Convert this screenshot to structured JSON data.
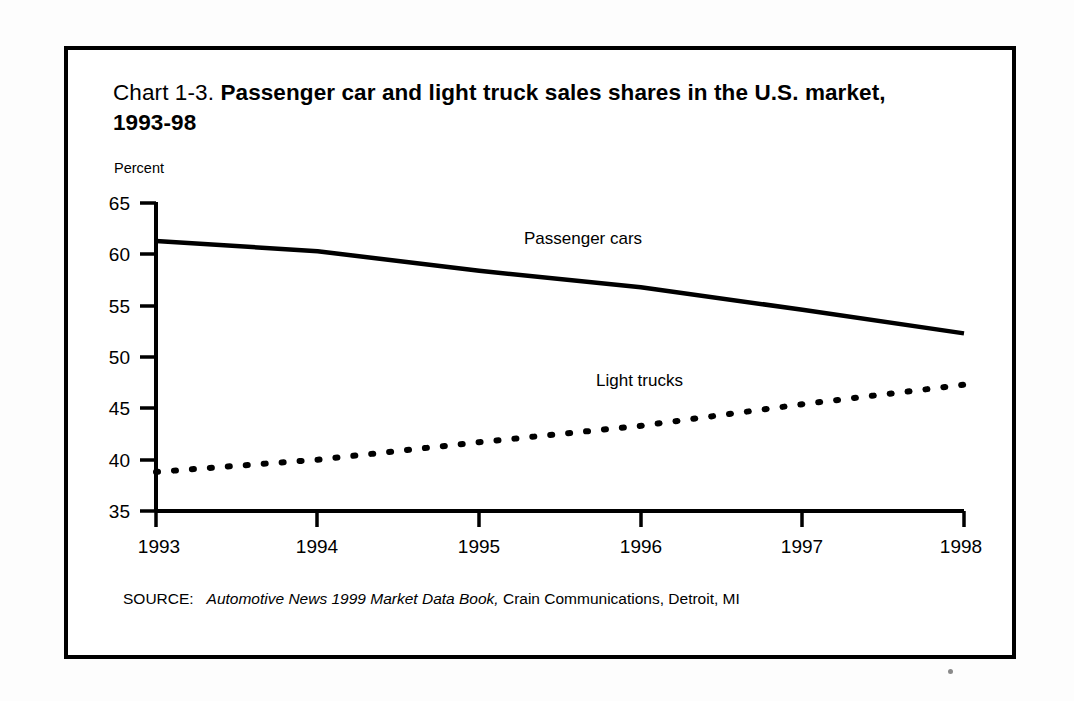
{
  "page": {
    "background_color": "#ffffff",
    "frame_color": "#000000"
  },
  "title": {
    "lead": "Chart 1-3.",
    "strong": "Passenger car and light truck sales shares in the U.S. market, 1993-98"
  },
  "axis": {
    "y_axis_title": "Percent",
    "y_ticks": [
      "65",
      "60",
      "55",
      "50",
      "45",
      "40",
      "35"
    ],
    "x_ticks": [
      "1993",
      "1994",
      "1995",
      "1996",
      "1997",
      "1998"
    ]
  },
  "series_labels": {
    "passenger": "Passenger cars",
    "trucks": "Light trucks"
  },
  "source": {
    "prefix": "SOURCE:",
    "italic": "Automotive News 1999 Market Data Book,",
    "rest": "Crain Communications, Detroit, MI"
  },
  "chart_data": {
    "type": "line",
    "title": "Chart 1-3. Passenger car and light truck sales shares in the U.S. market, 1993-98",
    "xlabel": "",
    "ylabel": "Percent",
    "x": [
      1993,
      1994,
      1995,
      1996,
      1997,
      1998
    ],
    "categories": [
      "1993",
      "1994",
      "1995",
      "1996",
      "1997",
      "1998"
    ],
    "ylim": [
      35,
      65
    ],
    "xlim": [
      1993,
      1998
    ],
    "ytick_values": [
      65,
      60,
      55,
      50,
      45,
      40,
      35
    ],
    "grid": false,
    "legend": "inline-labels",
    "series": [
      {
        "name": "Passenger cars",
        "style": "solid",
        "color": "#000000",
        "values": [
          61.3,
          60.3,
          58.4,
          56.8,
          54.6,
          52.3
        ]
      },
      {
        "name": "Light trucks",
        "style": "dotted",
        "color": "#000000",
        "values": [
          38.8,
          40.0,
          41.7,
          43.3,
          45.4,
          47.3
        ]
      }
    ],
    "annotations": [
      {
        "text": "Passenger cars",
        "x": 1996.05,
        "y": 59.6
      },
      {
        "text": "Light trucks",
        "x": 1996.25,
        "y": 46.3
      }
    ],
    "source": "SOURCE: Automotive News 1999 Market Data Book, Crain Communications, Detroit, MI"
  }
}
